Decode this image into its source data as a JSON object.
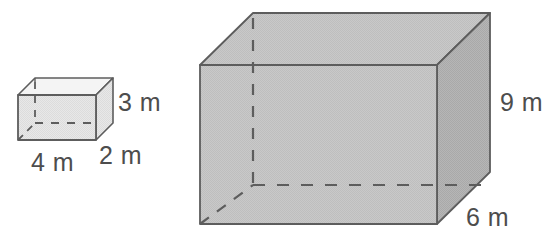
{
  "figure": {
    "background_color": "#ffffff",
    "stroke_color": "#595959",
    "label_color": "#4d4d4d",
    "shapes": [
      {
        "name": "small-rectangular-prism",
        "description": "Small open-top rectangular prism drawn in oblique projection",
        "face_front_color": "#e6e6e6",
        "face_top_color": "#f2f2f2",
        "face_side_color": "#dcdcdc",
        "dimensions": [
          {
            "id": "width",
            "value": 4,
            "unit": "m",
            "label": "4 m"
          },
          {
            "id": "depth",
            "value": 2,
            "unit": "m",
            "label": "2 m"
          },
          {
            "id": "height",
            "value": 3,
            "unit": "m",
            "label": "3 m"
          }
        ],
        "labels": {
          "height": "3 m",
          "width": "4 m",
          "depth": "2 m"
        }
      },
      {
        "name": "large-rectangular-prism",
        "description": "Large shaded rectangular prism drawn in oblique projection",
        "face_front_color": "#c4c4c4",
        "face_top_color": "#cccccc",
        "face_side_color": "#b0b0b0",
        "dimensions": [
          {
            "id": "height",
            "value": 9,
            "unit": "m",
            "label": "9 m"
          },
          {
            "id": "depth",
            "value": 6,
            "unit": "m",
            "label": "6 m"
          }
        ],
        "labels": {
          "height": "9 m",
          "depth": "6 m"
        }
      }
    ]
  },
  "labels": {
    "small_height": "3 m",
    "small_width": "4 m",
    "small_depth": "2 m",
    "large_height": "9 m",
    "large_depth": "6 m"
  }
}
